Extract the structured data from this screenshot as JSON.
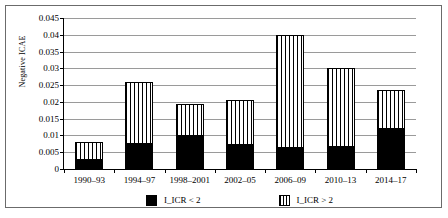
{
  "chart_data": {
    "type": "bar",
    "stacked": true,
    "title": "",
    "xlabel": "",
    "ylabel": "Negative ICAE",
    "ylim": [
      0,
      0.045
    ],
    "ytick_labels": [
      "0",
      "0.005",
      "0.01",
      "0.015",
      "0.02",
      "0.025",
      "0.03",
      "0.035",
      "0.04",
      "0.045"
    ],
    "ytick_values": [
      0,
      0.005,
      0.01,
      0.015,
      0.02,
      0.025,
      0.03,
      0.035,
      0.04,
      0.045
    ],
    "grid": true,
    "legend_position": "bottom",
    "categories": [
      "1990–93",
      "1994–97",
      "1998–2001",
      "2002–05",
      "2006–09",
      "2010–13",
      "2014–17"
    ],
    "series": [
      {
        "name": "I_ICR < 2",
        "fill": "solid-black",
        "color": "#000000",
        "values": [
          0.0026,
          0.0075,
          0.0098,
          0.0073,
          0.0063,
          0.0065,
          0.0118
        ]
      },
      {
        "name": "I_ICR > 2",
        "fill": "vertical-stripes",
        "color": "#ffffff",
        "values": [
          0.0055,
          0.0185,
          0.0097,
          0.0132,
          0.0337,
          0.0235,
          0.0117
        ]
      }
    ],
    "totals": [
      0.0081,
      0.026,
      0.0195,
      0.0205,
      0.04,
      0.03,
      0.0235
    ]
  },
  "legend": {
    "entries": [
      {
        "label": "I_ICR < 2"
      },
      {
        "label": "I_ICR > 2"
      }
    ]
  }
}
